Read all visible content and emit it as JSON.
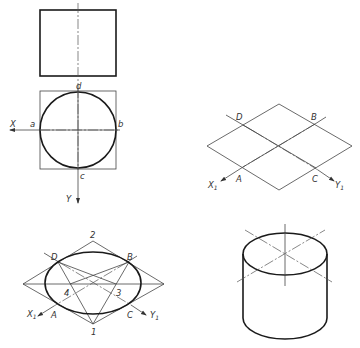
{
  "figure": {
    "colors": {
      "line": "#1a1a1a",
      "thin_line": "#444444",
      "background": "#ffffff"
    }
  },
  "views": {
    "front_view": {
      "name": "Front view (rectangle)",
      "rect": [
        40,
        10,
        76,
        66
      ]
    },
    "top_view": {
      "name": "Top view (circle in square)",
      "labels": {
        "d": "d",
        "a": "a",
        "b": "b",
        "c": "c",
        "x_axis": "X",
        "y_axis": "Y"
      }
    },
    "step_rhombus": {
      "name": "Isometric rhombus",
      "labels": {
        "D": "D",
        "B": "B",
        "A": "A",
        "C": "C",
        "x1_axis": "X",
        "x1_sub": "1",
        "y1_axis": "Y",
        "y1_sub": "1"
      }
    },
    "step_ellipse": {
      "name": "Four-center ellipse construction",
      "labels": {
        "p1": "1",
        "p2": "2",
        "p3": "3",
        "p4": "4",
        "D": "D",
        "B": "B",
        "A": "A",
        "C": "C",
        "x1_axis": "X",
        "x1_sub": "1",
        "y1_axis": "Y",
        "y1_sub": "1"
      }
    },
    "result_cylinder": {
      "name": "Finished isometric cylinder"
    }
  }
}
